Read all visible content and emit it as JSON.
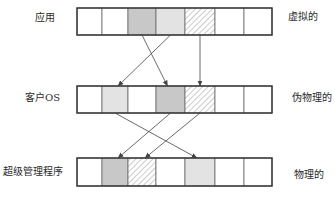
{
  "diagram": {
    "layers": [
      {
        "id": "application",
        "label": "应用",
        "label_right": "虚拟的",
        "cells": [
          "empty",
          "empty",
          "dark",
          "light",
          "hatched",
          "empty",
          "empty"
        ]
      },
      {
        "id": "guest-os",
        "label": "客户OS",
        "label_right": "伪物理的",
        "cells": [
          "empty",
          "light",
          "empty",
          "dark",
          "hatched",
          "empty",
          "empty"
        ]
      },
      {
        "id": "hypervisor",
        "label": "超级管理程序",
        "label_right": "物理的",
        "cells": [
          "empty",
          "dark",
          "hatched",
          "empty",
          "light",
          "empty",
          "empty"
        ]
      }
    ],
    "mappings": [
      {
        "from_layer": 0,
        "from_cell": 2,
        "to_layer": 1,
        "to_cell": 3
      },
      {
        "from_layer": 0,
        "from_cell": 3,
        "to_layer": 1,
        "to_cell": 1
      },
      {
        "from_layer": 0,
        "from_cell": 4,
        "to_layer": 1,
        "to_cell": 4
      },
      {
        "from_layer": 1,
        "from_cell": 1,
        "to_layer": 2,
        "to_cell": 4
      },
      {
        "from_layer": 1,
        "from_cell": 3,
        "to_layer": 2,
        "to_cell": 1
      },
      {
        "from_layer": 1,
        "from_cell": 4,
        "to_layer": 2,
        "to_cell": 2
      }
    ],
    "fill_colors": {
      "empty": "#ffffff",
      "dark": "#c8c8c8",
      "light": "#e3e3e3",
      "hatched_stroke": "#a8a8a8",
      "border": "#333333",
      "divider": "#6a6a6a",
      "arrow": "#444444"
    }
  }
}
